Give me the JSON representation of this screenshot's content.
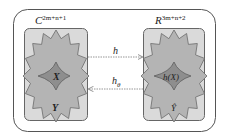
{
  "diagram": {
    "left_space": {
      "label_base": "C",
      "label_exponent": "2m+n+1",
      "inner_label": "X",
      "outer_label": "Y"
    },
    "right_space": {
      "label_base": "R",
      "label_exponent": "3m+n+2",
      "inner_label": "h(X)",
      "outer_label": "Ŷ"
    },
    "arrows": [
      {
        "label": "h",
        "subscript": "",
        "direction": "left-to-right"
      },
      {
        "label": "h",
        "subscript": "θ",
        "direction": "right-to-left"
      }
    ],
    "colors": {
      "outer_frame": "#555555",
      "panel_fill": "#d9d9d9",
      "star_outer_fill": "#b3b3b3",
      "star_inner_fill": "#8c8c8c",
      "stroke": "#6a6a6a",
      "arrow": "#8a8a8a"
    }
  }
}
